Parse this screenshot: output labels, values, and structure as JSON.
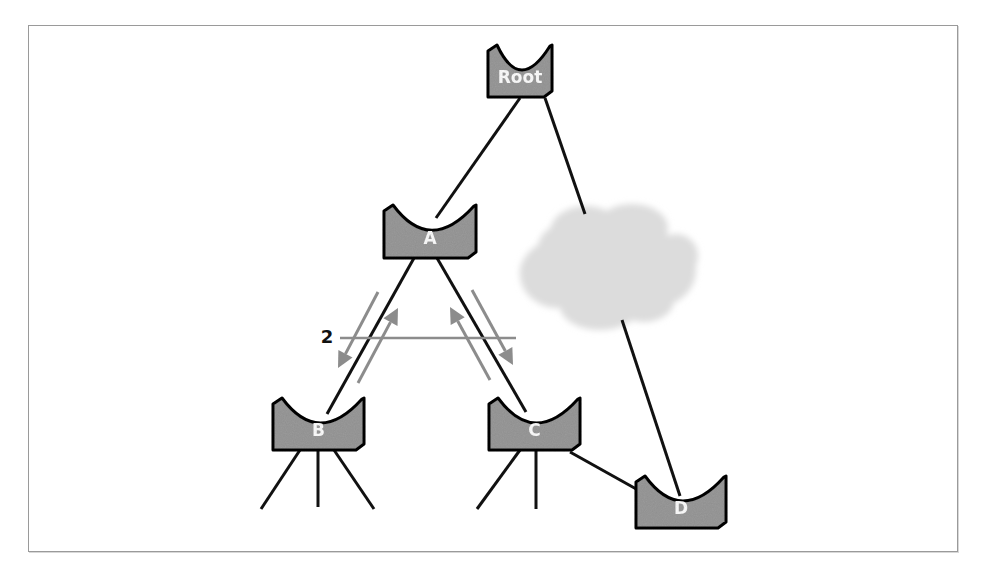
{
  "figure": {
    "caption": ""
  },
  "colors": {
    "switch_fill": "#9b9b9b",
    "switch_stroke": "#111111",
    "label": "#ffffff",
    "link": "#111111",
    "bpdu_arrow": "#8c8c8c",
    "cloud": "#dcdcdc",
    "frame": "#9a9a9a"
  },
  "nodes": [
    {
      "id": "root",
      "label": "Root",
      "x": 488,
      "y": 45,
      "w": 64,
      "h": 52
    },
    {
      "id": "a",
      "label": "A",
      "x": 384,
      "y": 205,
      "w": 92,
      "h": 53
    },
    {
      "id": "b",
      "label": "B",
      "x": 273,
      "y": 398,
      "w": 91,
      "h": 52
    },
    {
      "id": "c",
      "label": "C",
      "x": 489,
      "y": 398,
      "w": 91,
      "h": 52
    },
    {
      "id": "d",
      "label": "D",
      "x": 636,
      "y": 476,
      "w": 90,
      "h": 52
    }
  ],
  "links": [
    {
      "from": "root",
      "to": "a",
      "x1": 520,
      "y1": 98,
      "x2": 436,
      "y2": 218
    },
    {
      "from": "root",
      "to": "cloud",
      "x1": 545,
      "y1": 98,
      "x2": 585,
      "y2": 214
    },
    {
      "from": "cloud",
      "to": "d",
      "x1": 622,
      "y1": 320,
      "x2": 680,
      "y2": 496
    },
    {
      "from": "a",
      "to": "b",
      "x1": 414,
      "y1": 258,
      "x2": 327,
      "y2": 414
    },
    {
      "from": "a",
      "to": "c",
      "x1": 437,
      "y1": 258,
      "x2": 526,
      "y2": 412
    },
    {
      "from": "c",
      "to": "d",
      "x1": 570,
      "y1": 452,
      "x2": 638,
      "y2": 490
    }
  ],
  "stubs": [
    {
      "x1": 300,
      "y1": 450,
      "x2": 261,
      "y2": 509
    },
    {
      "x1": 318,
      "y1": 450,
      "x2": 318,
      "y2": 507
    },
    {
      "x1": 334,
      "y1": 450,
      "x2": 374,
      "y2": 509
    },
    {
      "x1": 520,
      "y1": 450,
      "x2": 477,
      "y2": 509
    },
    {
      "x1": 536,
      "y1": 450,
      "x2": 536,
      "y2": 509
    }
  ],
  "bpdu_arrows": [
    {
      "x1": 378,
      "y1": 292,
      "x2": 338,
      "y2": 368
    },
    {
      "x1": 358,
      "y1": 383,
      "x2": 398,
      "y2": 308
    },
    {
      "x1": 490,
      "y1": 380,
      "x2": 450,
      "y2": 307
    },
    {
      "x1": 472,
      "y1": 290,
      "x2": 513,
      "y2": 365
    }
  ],
  "marker": {
    "label": "2",
    "line_x1": 340,
    "line_x2": 516,
    "y": 338,
    "label_x": 327
  },
  "cloud": {
    "cx": 608,
    "cy": 266,
    "label": "network cloud"
  }
}
